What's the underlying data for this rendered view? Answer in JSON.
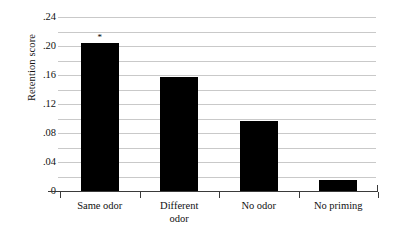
{
  "chart_data": {
    "type": "bar",
    "title": "",
    "xlabel": "",
    "ylabel": "Retention score",
    "categories": [
      "Same odor",
      "Different\nodor",
      "No odor",
      "No priming"
    ],
    "values": [
      0.205,
      0.158,
      0.097,
      0.015
    ],
    "ylim": [
      0,
      0.25
    ],
    "ytick_values": [
      0,
      0.04,
      0.08,
      0.12,
      0.16,
      0.2,
      0.24
    ],
    "ytick_labels": [
      "0",
      ".04",
      ".08",
      ".12",
      ".16",
      ".20",
      ".24"
    ],
    "minor_tick_values": [
      0.02,
      0.06,
      0.1,
      0.14,
      0.18,
      0.22
    ],
    "grid": true,
    "legend": "none",
    "bar_color": "#000000",
    "grid_color": "#c9c9c9",
    "annotations": [
      {
        "category": "Same odor",
        "text": "*",
        "value": 0.205
      }
    ]
  },
  "figure": {
    "background": "#ffffff",
    "axis_color": "#3a3a3a",
    "text_color": "#111111"
  }
}
